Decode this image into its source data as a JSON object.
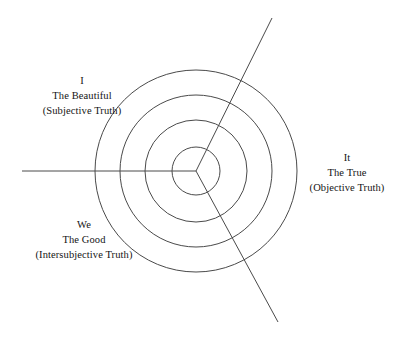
{
  "diagram": {
    "type": "concentric-sector-diagram",
    "title": "",
    "background_color": "#ffffff",
    "stroke_color": "#4a4a4a",
    "stroke_width": 1,
    "center": {
      "x": 196,
      "y": 171
    },
    "circles": [
      {
        "name": "innermost-circle",
        "radius": 24
      },
      {
        "name": "inner-middle-circle",
        "radius": 51
      },
      {
        "name": "outer-middle-circle",
        "radius": 76
      },
      {
        "name": "outermost-circle",
        "radius": 101
      }
    ],
    "rays": [
      {
        "name": "ray-west",
        "from": {
          "x": 196,
          "y": 171
        },
        "to": {
          "x": 22,
          "y": 171
        },
        "description": "horizontal ray extending left from center"
      },
      {
        "name": "ray-northeast",
        "from": {
          "x": 196,
          "y": 171
        },
        "to": {
          "x": 272,
          "y": 18
        },
        "description": "diagonal ray extending up and right from center"
      },
      {
        "name": "ray-southeast",
        "from": {
          "x": 196,
          "y": 171
        },
        "to": {
          "x": 278,
          "y": 322
        },
        "description": "diagonal ray extending down and right from center"
      }
    ],
    "sectors": [
      {
        "id": "upper-left",
        "pronoun": "I",
        "value": "The Beautiful",
        "truth": "(Subjective Truth)"
      },
      {
        "id": "right",
        "pronoun": "It",
        "value": "The True",
        "truth": "(Objective Truth)"
      },
      {
        "id": "lower-left",
        "pronoun": "We",
        "value": "The Good",
        "truth": "(Intersubjective Truth)"
      }
    ]
  }
}
